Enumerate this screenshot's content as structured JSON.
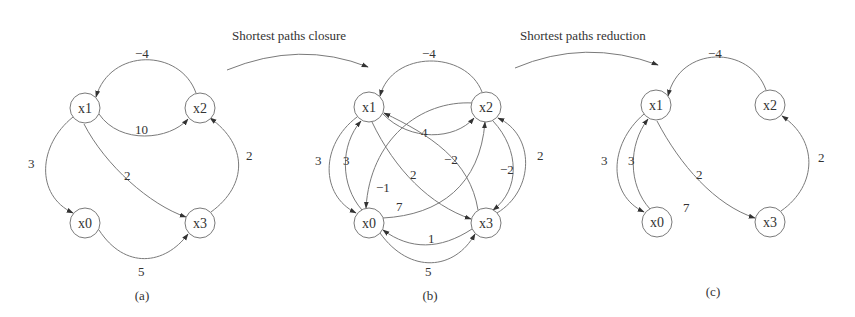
{
  "steps": [
    {
      "title": "Shortest paths closure"
    },
    {
      "title": "Shortest paths reduction"
    }
  ],
  "colors": {
    "stroke": "#7a7a7a",
    "text": "#333333",
    "background": "#ffffff"
  },
  "graphs": [
    {
      "caption": "(a)",
      "nodes": [
        "x0",
        "x1",
        "x2",
        "x3"
      ],
      "edges": [
        {
          "from": "x2",
          "to": "x1",
          "weight": "−4"
        },
        {
          "from": "x1",
          "to": "x2",
          "weight": "10"
        },
        {
          "from": "x1",
          "to": "x0",
          "weight": "3"
        },
        {
          "from": "x1",
          "to": "x3",
          "weight": "2"
        },
        {
          "from": "x3",
          "to": "x2",
          "weight": "2"
        },
        {
          "from": "x0",
          "to": "x3",
          "weight": "5"
        }
      ]
    },
    {
      "caption": "(b)",
      "nodes": [
        "x0",
        "x1",
        "x2",
        "x3"
      ],
      "edges": [
        {
          "from": "x2",
          "to": "x1",
          "weight": "−4"
        },
        {
          "from": "x1",
          "to": "x2",
          "weight": "4"
        },
        {
          "from": "x1",
          "to": "x0",
          "weight": "3"
        },
        {
          "from": "x0",
          "to": "x1",
          "weight": "3"
        },
        {
          "from": "x3",
          "to": "x1",
          "weight": "−2"
        },
        {
          "from": "x1",
          "to": "x3",
          "weight": "2"
        },
        {
          "from": "x2",
          "to": "x3",
          "weight": "−2"
        },
        {
          "from": "x3",
          "to": "x2",
          "weight": "2"
        },
        {
          "from": "x2",
          "to": "x0",
          "weight": "−1"
        },
        {
          "from": "x0",
          "to": "x2",
          "weight": "7"
        },
        {
          "from": "x3",
          "to": "x0",
          "weight": "1"
        },
        {
          "from": "x0",
          "to": "x3",
          "weight": "5"
        }
      ]
    },
    {
      "caption": "(c)",
      "nodes": [
        "x0",
        "x1",
        "x2",
        "x3"
      ],
      "edges": [
        {
          "from": "x2",
          "to": "x1",
          "weight": "−4"
        },
        {
          "from": "x1",
          "to": "x0",
          "weight": "3"
        },
        {
          "from": "x0",
          "to": "x1",
          "weight": "3"
        },
        {
          "from": "x1",
          "to": "x3",
          "weight": "2"
        },
        {
          "from": "x3",
          "to": "x2",
          "weight": "2"
        }
      ],
      "annotation": "7"
    }
  ]
}
